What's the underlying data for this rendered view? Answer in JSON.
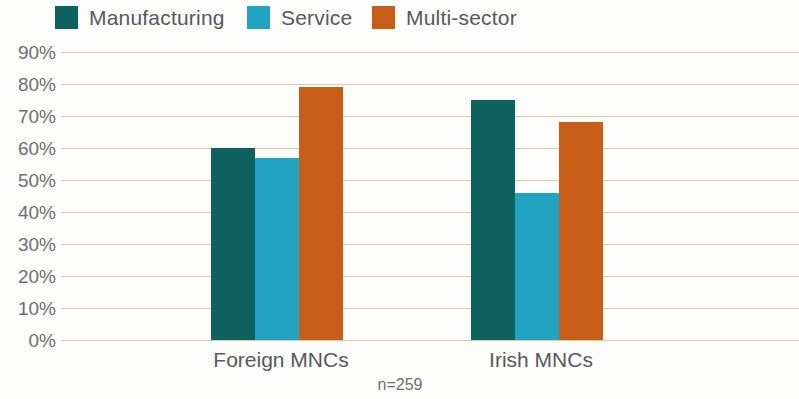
{
  "legend": {
    "position": "top",
    "items": [
      {
        "label": "Manufacturing",
        "color": "#0d615e",
        "swatch_name": "legend-swatch-manufacturing"
      },
      {
        "label": "Service",
        "color": "#22a3c2",
        "swatch_name": "legend-swatch-service"
      },
      {
        "label": "Multi-sector",
        "color": "#c85d18",
        "swatch_name": "legend-swatch-multi-sector"
      }
    ]
  },
  "footnote": "n=259",
  "colors": {
    "background": "#fdfdfb",
    "gridline": "#d9cfa6",
    "text": "#58595b",
    "tick_text": "#6d6e71",
    "manufacturing": "#0d615e",
    "service": "#22a3c2",
    "multi_sector": "#c85d18"
  },
  "chart_data": {
    "type": "bar",
    "title": "",
    "subtitle": "",
    "xlabel": "",
    "ylabel": "",
    "categories": [
      "Foreign MNCs",
      "Irish MNCs"
    ],
    "series": [
      {
        "name": "Manufacturing",
        "color": "#0d615e",
        "values": [
          60,
          75
        ]
      },
      {
        "name": "Service",
        "color": "#22a3c2",
        "values": [
          57,
          46
        ]
      },
      {
        "name": "Multi-sector",
        "color": "#c85d18",
        "values": [
          79,
          68
        ]
      }
    ],
    "ylim": [
      0,
      90
    ],
    "ytick_values": [
      90,
      80,
      70,
      60,
      50,
      40,
      30,
      20,
      10,
      0
    ],
    "ytick_labels": [
      "90%",
      "80%",
      "70%",
      "60%",
      "50%",
      "40%",
      "30%",
      "20%",
      "10%",
      "0%"
    ],
    "grid": true,
    "grid_axis": "y",
    "legend_position": "top",
    "annotations": [
      "n=259"
    ]
  }
}
